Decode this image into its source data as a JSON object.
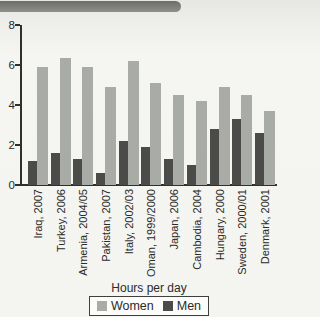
{
  "chart_data": {
    "type": "bar",
    "title": "",
    "xlabel": "Hours per day",
    "ylabel": "",
    "ylim": [
      0,
      8
    ],
    "yticks": [
      0,
      2,
      4,
      6,
      8
    ],
    "grid": false,
    "legend_position": "bottom",
    "categories": [
      "Iraq, 2007",
      "Turkey, 2006",
      "Armenia, 2004/05",
      "Pakistan, 2007",
      "Italy, 2002/03",
      "Oman, 1999/2000",
      "Japan, 2006",
      "Cambodia, 2004",
      "Hungary, 2000",
      "Sweden, 2000/01",
      "Denmark, 2001"
    ],
    "series": [
      {
        "name": "Women",
        "color": "#a9aca6",
        "values": [
          5.9,
          6.35,
          5.9,
          4.9,
          6.2,
          5.1,
          4.5,
          4.2,
          4.9,
          4.5,
          3.7
        ]
      },
      {
        "name": "Men",
        "color": "#4b4b49",
        "values": [
          1.2,
          1.6,
          1.3,
          0.6,
          2.2,
          1.9,
          1.3,
          1.0,
          2.8,
          3.3,
          2.6
        ]
      }
    ],
    "bar_order_in_group": [
      "Men",
      "Women"
    ]
  },
  "colors": {
    "banner": "#7c7c7a",
    "axis": "#2f2f2d",
    "page_bg": "#f4f4f0",
    "legend_border": "#3f3f3d",
    "legend_bg": "#fcfcfa"
  }
}
